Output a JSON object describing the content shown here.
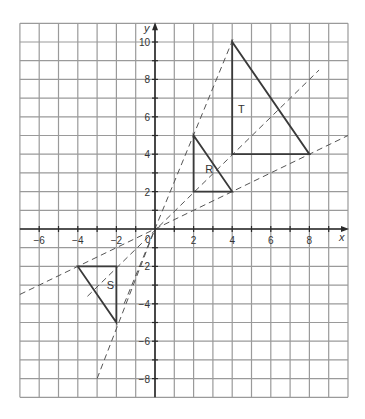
{
  "diagram": {
    "type": "coordinate-grid-enlargement",
    "axes": {
      "x_label": "x",
      "y_label": "y",
      "x_range": [
        -7,
        10
      ],
      "y_range": [
        -9,
        11
      ],
      "origin_label": "0",
      "x_ticks": [
        {
          "value": -6,
          "label": "−6"
        },
        {
          "value": -4,
          "label": "−4"
        },
        {
          "value": -2,
          "label": "−2"
        },
        {
          "value": 2,
          "label": "2"
        },
        {
          "value": 4,
          "label": "4"
        },
        {
          "value": 6,
          "label": "6"
        },
        {
          "value": 8,
          "label": "8"
        }
      ],
      "y_ticks": [
        {
          "value": 10,
          "label": "10"
        },
        {
          "value": 8,
          "label": "8"
        },
        {
          "value": 6,
          "label": "6"
        },
        {
          "value": 4,
          "label": "4"
        },
        {
          "value": 2,
          "label": "2"
        },
        {
          "value": -2,
          "label": "−2"
        },
        {
          "value": -4,
          "label": "−4"
        },
        {
          "value": -6,
          "label": "−6"
        },
        {
          "value": -8,
          "label": "−8"
        }
      ]
    },
    "shapes": [
      {
        "name": "T",
        "label": "T",
        "vertices": [
          [
            4,
            4
          ],
          [
            4,
            10
          ],
          [
            8,
            4
          ]
        ],
        "label_pos": [
          4.3,
          6.2
        ]
      },
      {
        "name": "R",
        "label": "R",
        "vertices": [
          [
            2,
            2
          ],
          [
            2,
            5
          ],
          [
            4,
            2
          ]
        ],
        "label_pos": [
          2.6,
          3.0
        ]
      },
      {
        "name": "S",
        "label": "S",
        "vertices": [
          [
            -2,
            -2
          ],
          [
            -4,
            -2
          ],
          [
            -2,
            -5
          ]
        ],
        "label_pos": [
          -2.5,
          -3.2
        ]
      }
    ],
    "dashed_lines": [
      {
        "through": [
          4,
          10
        ],
        "from": [
          -1.6,
          -4
        ],
        "to": [
          4.1,
          10.3
        ]
      },
      {
        "through": [
          4,
          4
        ],
        "from": [
          -3.5,
          -3.6
        ],
        "to": [
          8.5,
          8.5
        ]
      },
      {
        "through": [
          8,
          4
        ],
        "from": [
          -7,
          -3.5
        ],
        "to": [
          10,
          5
        ]
      },
      {
        "through": [
          -2,
          -5
        ],
        "from": [
          -3.0,
          -8.0
        ],
        "to": [
          0,
          0
        ]
      }
    ],
    "colors": {
      "grid": "#9a9a9a",
      "axis": "#2a2a2a",
      "shape": "#3a3a3a",
      "dashed": "#555555",
      "text": "#333333"
    }
  }
}
